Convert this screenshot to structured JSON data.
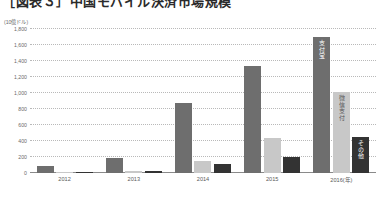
{
  "title": "［図表３］中国モバイル決済市場規模",
  "unit_caption": "(10億ドル)",
  "colors": {
    "alipay": "#6e6e6e",
    "wechat": "#c8c8c8",
    "other": "#333333",
    "gridline": "#b9b9b9",
    "axis": "#8a8a8a",
    "text": "#6b6b6b"
  },
  "chart_data": {
    "type": "bar",
    "title": "［図表３］中国モバイル決済市場規模",
    "subtitle": "",
    "xlabel": "",
    "ylabel": "(10億ドル)",
    "ylim": [
      0,
      1800
    ],
    "ytick_interval": 200,
    "yticks": [
      "0",
      "200",
      "400",
      "600",
      "800",
      "1,000",
      "1,200",
      "1,400",
      "1,600",
      "1,800"
    ],
    "ytick_values": [
      0,
      200,
      400,
      600,
      800,
      1000,
      1200,
      1400,
      1600,
      1800
    ],
    "grid": true,
    "grid_style": "dotted-horizontal",
    "legend": "inline-bar-labels",
    "legend_position": "on-bars-2016",
    "categories": [
      "2012",
      "2013",
      "2014",
      "2015",
      "2016"
    ],
    "xtick_labels": [
      "2012",
      "2013",
      "2014",
      "2015",
      "2016(年)"
    ],
    "series": [
      {
        "name": "支付宝",
        "color": "#6e6e6e",
        "values": [
          90,
          190,
          880,
          1340,
          1700
        ]
      },
      {
        "name": "微信支付",
        "color": "#c8c8c8",
        "values": [
          10,
          30,
          150,
          440,
          1010
        ]
      },
      {
        "name": "その他",
        "color": "#333333",
        "values": [
          5,
          20,
          110,
          200,
          450
        ]
      }
    ]
  }
}
